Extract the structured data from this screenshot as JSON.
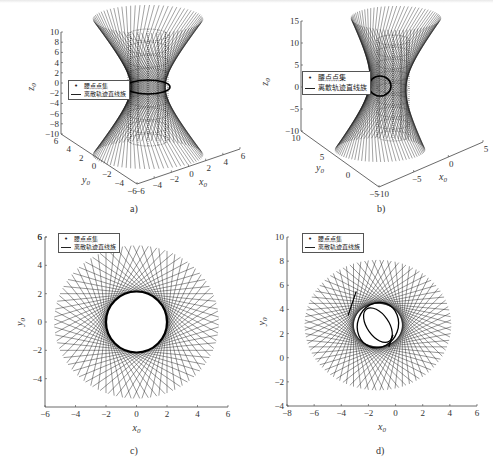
{
  "figure": {
    "legend": {
      "point_label": "腰点点集",
      "line_label": "离散轨迹直线族"
    },
    "captions": [
      "a)",
      "b)",
      "c)",
      "d)"
    ]
  },
  "chart_data": [
    {
      "panel": "a",
      "type": "line",
      "projection": "3d",
      "title": "",
      "xlabel": "x0",
      "ylabel": "y0",
      "zlabel": "z0",
      "x_ticks": [
        -6,
        -4,
        -2,
        0,
        2,
        4,
        6
      ],
      "y_ticks": [
        -6,
        -4,
        -2,
        0,
        2,
        4,
        6
      ],
      "z_ticks": [
        -10,
        -8,
        -6,
        -4,
        -2,
        0,
        2,
        4,
        6,
        8,
        10
      ],
      "xlim": [
        -6,
        6
      ],
      "ylim": [
        -6,
        6
      ],
      "zlim": [
        -10,
        10
      ],
      "description": "Hyperboloid ruled-line family (one-sheet) with waist circle radius ~2 at z=0 and cylinder of waist points",
      "waist_radius": 2,
      "line_count": 72,
      "series": [
        {
          "name": "腰点点集",
          "style": "dots"
        },
        {
          "name": "离散轨迹直线族",
          "style": "line"
        }
      ]
    },
    {
      "panel": "b",
      "type": "line",
      "projection": "3d",
      "xlabel": "x0",
      "ylabel": "y0",
      "zlabel": "z0",
      "x_ticks": [
        -10,
        -5,
        0,
        5
      ],
      "y_ticks": [
        -5,
        0,
        5,
        10
      ],
      "z_ticks": [
        -10,
        -5,
        0,
        5,
        10,
        15
      ],
      "xlim": [
        -10,
        5
      ],
      "ylim": [
        -5,
        10
      ],
      "zlim": [
        -10,
        15
      ],
      "description": "Skewed/tilted hyperboloid line family with offset waist",
      "line_count": 72,
      "series": [
        {
          "name": "腰点点集",
          "style": "dots"
        },
        {
          "name": "离散轨迹直线族",
          "style": "line"
        }
      ]
    },
    {
      "panel": "c",
      "type": "line",
      "projection": "xy",
      "xlabel": "x0",
      "ylabel": "y0",
      "x_ticks": [
        -6,
        -4,
        -2,
        0,
        2,
        4,
        6
      ],
      "y_ticks": [
        -4,
        -2,
        0,
        2,
        4,
        6
      ],
      "xlim": [
        -6,
        6
      ],
      "ylim": [
        -6,
        6
      ],
      "description": "Top view: tangent lines to circle radius 2 centered at origin, endpoints at radius ~5.4",
      "center": [
        0,
        0
      ],
      "inner_radius": 2,
      "outer_radius": 5.4,
      "line_count": 60,
      "series": [
        {
          "name": "腰点点集",
          "style": "dots"
        },
        {
          "name": "离散轨迹直线族",
          "style": "line"
        }
      ]
    },
    {
      "panel": "d",
      "type": "line",
      "projection": "xy",
      "xlabel": "x0",
      "ylabel": "y0",
      "x_ticks": [
        -8,
        -6,
        -4,
        -2,
        0,
        2,
        4,
        6
      ],
      "y_ticks": [
        -4,
        -2,
        0,
        2,
        4,
        6,
        8,
        10
      ],
      "xlim": [
        -8,
        6
      ],
      "ylim": [
        -4,
        10
      ],
      "description": "Top view of tilted case: line family envelope around an elliptical waist centered near (-1.3, 2.7)",
      "center": [
        -1.3,
        2.7
      ],
      "inner_radius": 1.8,
      "outer_radius": 5.4,
      "line_count": 60,
      "series": [
        {
          "name": "腰点点集",
          "style": "dots"
        },
        {
          "name": "离散轨迹直线族",
          "style": "line"
        }
      ]
    }
  ]
}
